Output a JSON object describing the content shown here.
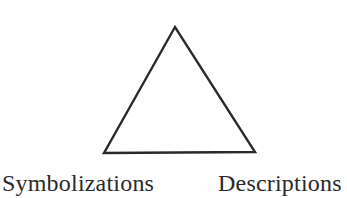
{
  "diagram": {
    "shape": "triangle",
    "stroke_color": "#2a2a2a",
    "vertices": {
      "apex": [
        175,
        27
      ],
      "bottom_left": [
        104,
        153
      ],
      "bottom_right": [
        255,
        152
      ]
    },
    "labels": {
      "bottom_left": "Symbolizations",
      "bottom_right": "Descriptions"
    }
  }
}
